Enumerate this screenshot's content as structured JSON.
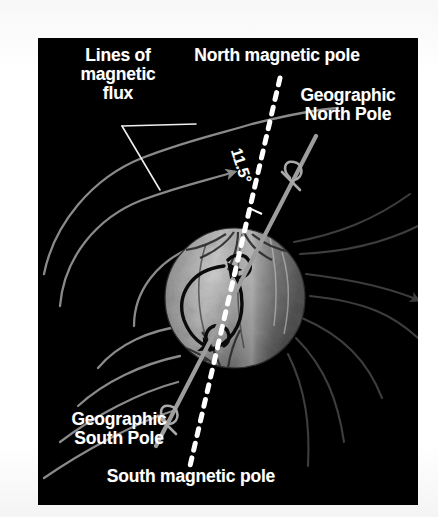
{
  "figure": {
    "kind": "scientific-diagram",
    "background_color": "#000000",
    "page_color": "#ffffff",
    "text_color": "#ffffff"
  },
  "labels": {
    "lines_of_flux": "Lines of\nmagnetic\nflux",
    "north_magnetic_pole": "North magnetic pole",
    "geographic_north_pole": "Geographic\nNorth Pole",
    "geographic_south_pole": "Geographic\nSouth Pole",
    "south_magnetic_pole": "South magnetic pole",
    "tilt_angle": "11.5°"
  },
  "elements": {
    "globe": {
      "name": "earth-globe",
      "center_x": 197,
      "center_y": 260,
      "radius": 70,
      "fill_light": "#c9c9c9",
      "fill_mid": "#8d8d8d",
      "fill_dark": "#4e4e4e"
    },
    "magnetic_axis": {
      "name": "magnetic-dipole-axis",
      "style": "dashed",
      "color": "#ffffff",
      "x1": 242,
      "y1": 40,
      "x2": 152,
      "y2": 428
    },
    "rotation_axis": {
      "name": "geographic-rotation-axis",
      "style": "solid",
      "color": "#9d9d9d",
      "x1": 278,
      "y1": 98,
      "x2": 118,
      "y2": 408
    },
    "field_lines": {
      "name": "magnetic-flux-lines",
      "color_left": "#8a8a8a",
      "color_right": "#3a3a3a",
      "count": 10
    },
    "dynamo_arrows": {
      "name": "internal-current-loop",
      "color": "#000000"
    },
    "leader_lines": {
      "name": "flux-label-leader-lines",
      "color": "#efefef"
    }
  }
}
